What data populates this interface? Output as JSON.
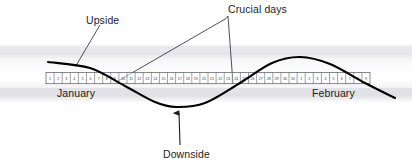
{
  "figure": {
    "background_color": "#ffffff",
    "curve_color": "#000000",
    "leader_color": "#3a3a44",
    "band_color": "#e9e9ee",
    "strip_border_color": "#55555e",
    "text_color": "#1d1d1d"
  },
  "annotations": {
    "upside": "Upside",
    "crucial_days": "Crucial days",
    "downside": "Downside"
  },
  "months": [
    {
      "name": "January",
      "days": [
        1,
        2,
        3,
        4,
        5,
        6,
        7,
        8,
        9,
        10,
        11,
        12,
        13,
        14,
        15,
        16,
        17,
        18,
        19,
        20,
        21,
        22,
        23,
        24,
        25,
        26,
        27,
        28,
        29,
        30,
        31
      ]
    },
    {
      "name": "February",
      "days": [
        1,
        2,
        3,
        4,
        5,
        6,
        7,
        8,
        9
      ]
    }
  ],
  "month_labels": {
    "january": "January",
    "february": "February"
  },
  "chart_data": {
    "type": "line",
    "title": "",
    "xlabel": "",
    "ylabel": "",
    "grid": false,
    "legend": "none",
    "series": [
      {
        "name": "cycle",
        "description": "sine-like cycle crossing the calendar baseline at the crucial days",
        "points": [
          {
            "x": 48,
            "y": 62
          },
          {
            "x": 90,
            "y": 68
          },
          {
            "x": 125,
            "y": 86
          },
          {
            "x": 155,
            "y": 102
          },
          {
            "x": 176,
            "y": 107
          },
          {
            "x": 205,
            "y": 103
          },
          {
            "x": 240,
            "y": 83
          },
          {
            "x": 272,
            "y": 63
          },
          {
            "x": 300,
            "y": 57
          },
          {
            "x": 330,
            "y": 64
          },
          {
            "x": 365,
            "y": 83
          },
          {
            "x": 395,
            "y": 98
          }
        ]
      }
    ],
    "markers": [
      {
        "name": "upside-point",
        "x": 86,
        "y": 66
      },
      {
        "name": "crucial-day-left",
        "x": 118,
        "y": 82
      },
      {
        "name": "crucial-day-right",
        "x": 233,
        "y": 84
      },
      {
        "name": "downside-trough",
        "x": 178,
        "y": 110
      }
    ]
  }
}
